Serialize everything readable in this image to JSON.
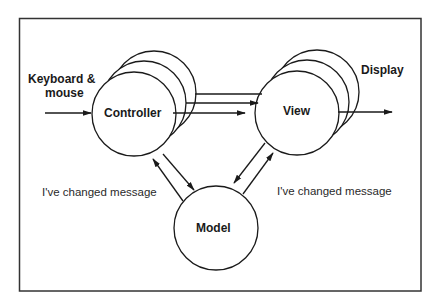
{
  "diagram": {
    "title": "",
    "nodes": {
      "controller": {
        "label": "Controller"
      },
      "view": {
        "label": "View"
      },
      "model": {
        "label": "Model"
      }
    },
    "external": {
      "input_label_line1": "Keyboard &",
      "input_label_line2": "mouse",
      "output_label": "Display"
    },
    "messages": {
      "left": "I've changed message",
      "right": "I've changed message"
    },
    "colors": {
      "stroke": "#1a1a1a",
      "background": "#ffffff"
    }
  }
}
